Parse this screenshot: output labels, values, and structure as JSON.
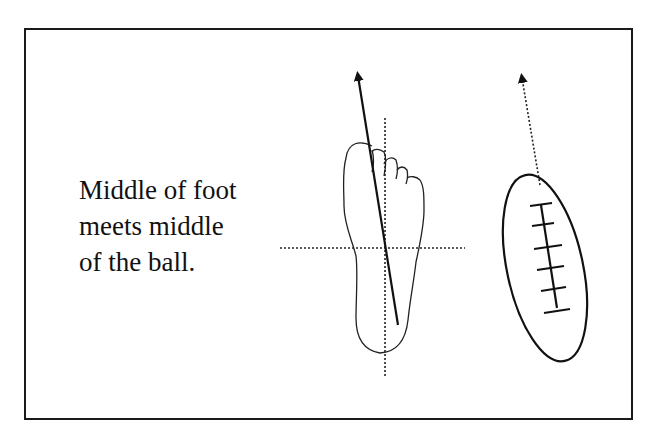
{
  "caption": {
    "lines": [
      "Middle of foot",
      "meets middle",
      "of the ball."
    ]
  },
  "figures": {
    "foot": {
      "label": "foot-outline",
      "arrow": "solid"
    },
    "ball": {
      "label": "football-with-laces",
      "arrow": "dotted"
    }
  },
  "colors": {
    "ink": "#111111",
    "background": "#ffffff"
  }
}
